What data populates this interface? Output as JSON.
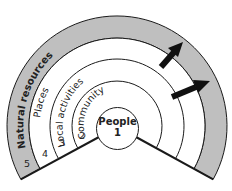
{
  "diagram": {
    "type": "concentric-rings",
    "colors": {
      "outer_band": "#bfbfbf",
      "stroke": "#1a1a1a",
      "background": "#ffffff",
      "arrows": "#111111"
    },
    "center": {
      "label": "People",
      "number": "1"
    },
    "rings": [
      {
        "number": "2",
        "label": "Community"
      },
      {
        "number": "3",
        "label": "Local activities"
      },
      {
        "number": "4",
        "label": "Places"
      },
      {
        "number": "5",
        "label": "Natural resources"
      }
    ],
    "arrows": [
      {
        "name": "upper-arrow",
        "direction": "outward"
      },
      {
        "name": "lower-arrow",
        "direction": "outward"
      }
    ]
  }
}
